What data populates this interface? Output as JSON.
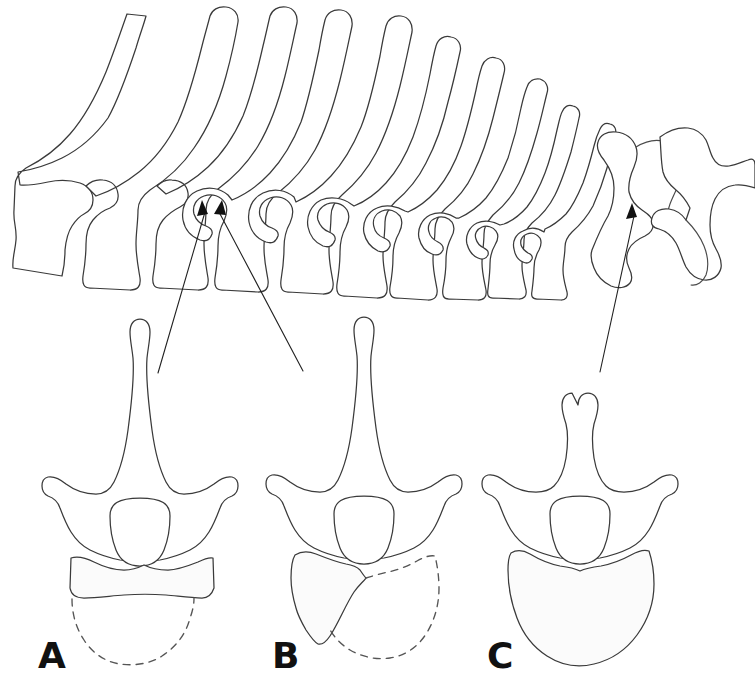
{
  "figure": {
    "kind": "anatomical-line-drawing",
    "background_color": "#ffffff",
    "line_color": "#3a3a3a",
    "label_color": "#111111",
    "width": 755,
    "height": 698
  },
  "panels": [
    {
      "id": "A",
      "label": "A",
      "label_x": 38,
      "label_y": 668,
      "body_outline": "solid-band-plus-dashed-arc",
      "description": "vertebra with tall spinous process, paired transverse processes, rounded neural canal, horizontal epiphyseal band and dashed centrum outline"
    },
    {
      "id": "B",
      "label": "B",
      "label_x": 272,
      "label_y": 668,
      "body_outline": "partial-solid-plus-dashed-arc",
      "description": "vertebra with tall spinous process, asymmetric partially ossified centrum on the left and dashed centrum outline on the right"
    },
    {
      "id": "C",
      "label": "C",
      "label_x": 487,
      "label_y": 668,
      "body_outline": "solid-complete",
      "description": "vertebra with short spinous process and fully ossified solid rounded centrum"
    }
  ],
  "column": {
    "segment_count": 12,
    "orientation": "lateral view, cranial at left, caudal at right",
    "description": "articulated series of vertebrae with long spinous processes at the left grading into short processes and sacrum at the right"
  },
  "annotations": [
    {
      "id": "leader-a",
      "points_to_panel": "A",
      "arrow_tip_x": 202,
      "arrow_tip_y": 203,
      "tail_x": 158,
      "tail_y": 373,
      "crosses": true
    },
    {
      "id": "leader-b",
      "points_to_panel": "B",
      "arrow_tip_x": 222,
      "arrow_tip_y": 203,
      "tail_x": 303,
      "tail_y": 371,
      "crosses": true
    },
    {
      "id": "leader-c",
      "points_to_panel": "C",
      "arrow_tip_x": 632,
      "arrow_tip_y": 205,
      "tail_x": 600,
      "tail_y": 372,
      "crosses": false
    }
  ]
}
